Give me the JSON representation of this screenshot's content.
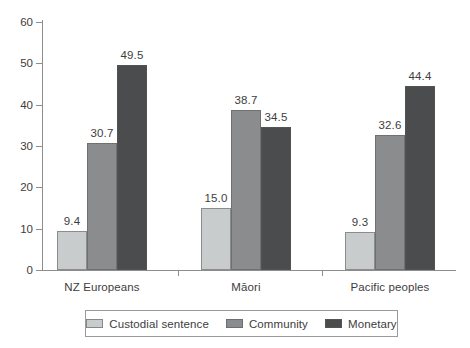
{
  "chart_data": {
    "type": "bar",
    "title": "",
    "subtitle": "",
    "xlabel": "",
    "ylabel": "",
    "ylim": [
      0,
      60
    ],
    "yticks": [
      0,
      10,
      20,
      30,
      40,
      50,
      60
    ],
    "ytick_labels": [
      "0",
      "10",
      "20",
      "30",
      "40",
      "50",
      "60"
    ],
    "grid": false,
    "legend_position": "bottom",
    "categories": [
      "NZ Europeans",
      "Māori",
      "Pacific peoples"
    ],
    "series": [
      {
        "name": "Custodial sentence",
        "color": "#c8cccd",
        "values": [
          9.4,
          15.0,
          9.3
        ],
        "labels": [
          "9.4",
          "15.0",
          "9.3"
        ]
      },
      {
        "name": "Community",
        "color": "#8a8c8d",
        "values": [
          30.7,
          38.7,
          32.6
        ],
        "labels": [
          "30.7",
          "38.7",
          "32.6"
        ]
      },
      {
        "name": "Monetary",
        "color": "#4a4c4d",
        "values": [
          49.5,
          34.5,
          44.4
        ],
        "labels": [
          "49.5",
          "34.5",
          "44.4"
        ]
      }
    ]
  },
  "legend": {
    "items": [
      {
        "label": "Custodial sentence",
        "series": 0
      },
      {
        "label": "Community",
        "series": 1
      },
      {
        "label": "Monetary",
        "series": 2
      }
    ]
  },
  "colors": {
    "axis": "#8d8d8d",
    "text": "#3d3d3d",
    "background": "#ffffff",
    "series_light": "#c8cccd",
    "series_medium": "#8a8c8d",
    "series_dark": "#4a4c4d"
  }
}
